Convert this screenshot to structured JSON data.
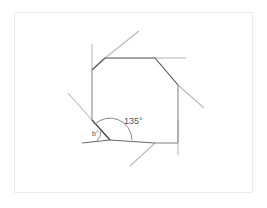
{
  "figure": {
    "shape_name": "octagon",
    "frame_color": "#ebebeb",
    "background_color": "#ffffff",
    "polygon_stroke": "#4a4a4a",
    "extension_stroke": "#b9b9b9",
    "arc_stroke": "#8a8a8a",
    "label_color": "#555555"
  },
  "labels": {
    "interior_angle": "135°",
    "exterior_angle": "b°"
  },
  "geometry": {
    "polygon_points": "105,58 155,58 178,85 178,143 155,143 110,140 92,120 92,70",
    "octagon_vertices": [
      {
        "name": "top-left",
        "x": 105,
        "y": 58
      },
      {
        "name": "top-right",
        "x": 155,
        "y": 58
      },
      {
        "name": "right-upper",
        "x": 178,
        "y": 85
      },
      {
        "name": "right-lower",
        "x": 178,
        "y": 143
      },
      {
        "name": "bottom-right",
        "x": 155,
        "y": 143
      },
      {
        "name": "bottom-left",
        "x": 110,
        "y": 140
      },
      {
        "name": "left-lower",
        "x": 92,
        "y": 120
      },
      {
        "name": "left-upper",
        "x": 92,
        "y": 70
      }
    ],
    "extensions": [
      {
        "name": "top-left-diagonal",
        "x1": 105,
        "y1": 58,
        "x2": 139,
        "y2": 31
      },
      {
        "name": "top-right-horizontal",
        "x1": 155,
        "y1": 58,
        "x2": 186,
        "y2": 58
      },
      {
        "name": "right-upper-diagonal",
        "x1": 178,
        "y1": 85,
        "x2": 204,
        "y2": 108
      },
      {
        "name": "right-vertical",
        "x1": 178,
        "y1": 143,
        "x2": 178,
        "y2": 155
      },
      {
        "name": "bottom-right-diagonal",
        "x1": 155,
        "y1": 143,
        "x2": 130,
        "y2": 166
      },
      {
        "name": "bottom-baseline",
        "x1": 110,
        "y1": 140,
        "x2": 82,
        "y2": 143
      },
      {
        "name": "left-lower-diagonal",
        "x1": 92,
        "y1": 120,
        "x2": 68,
        "y2": 93
      },
      {
        "name": "left-vertical",
        "x1": 92,
        "y1": 70,
        "x2": 92,
        "y2": 44
      }
    ],
    "interior_arc": {
      "cx": 110,
      "cy": 140,
      "r": 22
    },
    "exterior_arc": {
      "cx": 110,
      "cy": 140,
      "r": 13
    },
    "interior_label_pos": {
      "x": 128,
      "y": 122
    },
    "exterior_label_pos": {
      "x": 95,
      "y": 134
    }
  }
}
